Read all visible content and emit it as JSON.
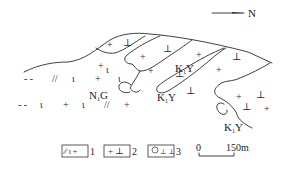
{
  "figure": {
    "type": "geological sketch map",
    "north_arrow": {
      "label": "N",
      "direction": "right"
    },
    "units": [
      {
        "code_main": "N",
        "code_sub": "1",
        "code_suffix": "G",
        "description": "Neogene unit (legend 1 symbols)"
      },
      {
        "code_main": "K",
        "code_sub": "1",
        "code_suffix": "Y",
        "description": "Lower Cretaceous unit (legend 2 symbols)"
      }
    ],
    "unit_labels": [
      {
        "main": "N",
        "sub": "1",
        "suffix": "G"
      },
      {
        "main": "K",
        "sub": "1",
        "suffix": "Y"
      },
      {
        "main": "K",
        "sub": "1",
        "suffix": "Y"
      },
      {
        "main": "K",
        "sub": "1",
        "suffix": "Y"
      }
    ],
    "legend": [
      {
        "symbols": "∕∕ ι +",
        "number": "1"
      },
      {
        "symbols": "+ ⊥",
        "number": "2"
      },
      {
        "symbols": "○․ ․",
        "number": "3"
      }
    ],
    "scale_bar": {
      "start": "0",
      "end": "150m"
    }
  }
}
